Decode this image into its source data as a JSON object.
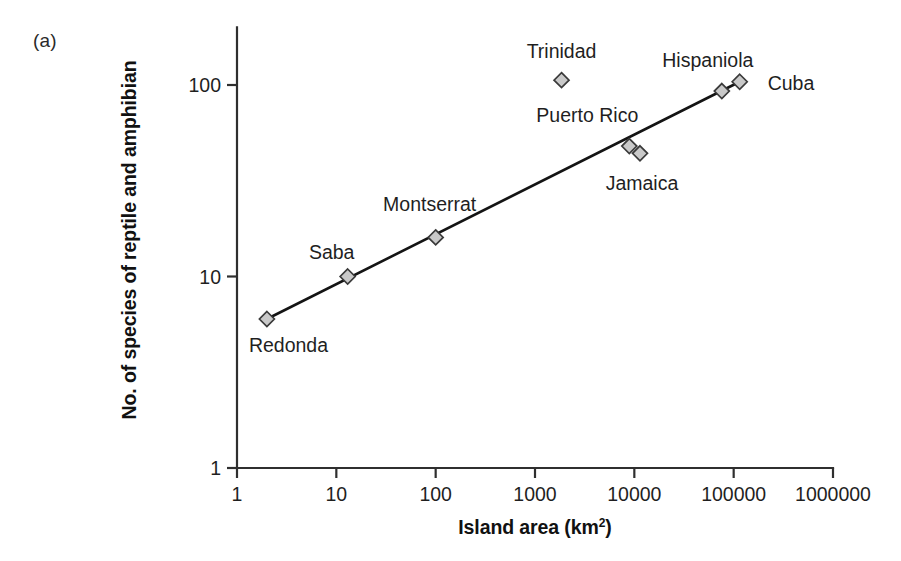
{
  "figure": {
    "panel_label": "(a)",
    "background_color": "#ffffff"
  },
  "chart_data": {
    "type": "scatter",
    "title": "",
    "xlabel": "Island area (km",
    "xlabel_superscript": "2",
    "xlabel_suffix": ")",
    "xlabel_full": "Island area (km²)",
    "ylabel": "No. of species of reptile and amphibian",
    "xscale": "log",
    "yscale": "log",
    "xlim": [
      1,
      1000000
    ],
    "ylim": [
      1,
      200
    ],
    "grid": false,
    "legend": "none",
    "xticks": [
      1,
      10,
      100,
      1000,
      10000,
      100000,
      1000000
    ],
    "xtick_labels": [
      "1",
      "10",
      "100",
      "1000",
      "10000",
      "100000",
      "1000000"
    ],
    "yticks": [
      1,
      10,
      100
    ],
    "ytick_labels": [
      "1",
      "10",
      "100"
    ],
    "marker_shape": "diamond",
    "marker_fill": "#c9c9c9",
    "marker_edge": "#3a3a3a",
    "line_color": "#141414",
    "points": [
      {
        "name": "Redonda",
        "area": 2,
        "species": 6,
        "label_dx": -18,
        "label_dy": 33,
        "label_anchor": "start"
      },
      {
        "name": "Saba",
        "area": 13,
        "species": 10,
        "label_dx": -16,
        "label_dy": -18,
        "label_anchor": "middle"
      },
      {
        "name": "Montserrat",
        "area": 100,
        "species": 16,
        "label_dx": -6,
        "label_dy": -26,
        "label_anchor": "middle"
      },
      {
        "name": "Trinidad",
        "area": 1850,
        "species": 106,
        "label_dx": 0,
        "label_dy": -22,
        "label_anchor": "middle"
      },
      {
        "name": "Puerto Rico",
        "area": 8900,
        "species": 48,
        "label_dx": -42,
        "label_dy": -24,
        "label_anchor": "middle"
      },
      {
        "name": "Jamaica",
        "area": 11400,
        "species": 44,
        "label_dx": 2,
        "label_dy": 37,
        "label_anchor": "middle"
      },
      {
        "name": "Hispaniola",
        "area": 76000,
        "species": 93,
        "label_dx": -14,
        "label_dy": -24,
        "label_anchor": "middle"
      },
      {
        "name": "Cuba",
        "area": 115000,
        "species": 104,
        "label_dx": 28,
        "label_dy": 8,
        "label_anchor": "start"
      }
    ],
    "fit_line": {
      "x_start": 2,
      "y_start": 6,
      "x_end": 115000,
      "y_end": 104,
      "description": "species-area regression line"
    }
  }
}
